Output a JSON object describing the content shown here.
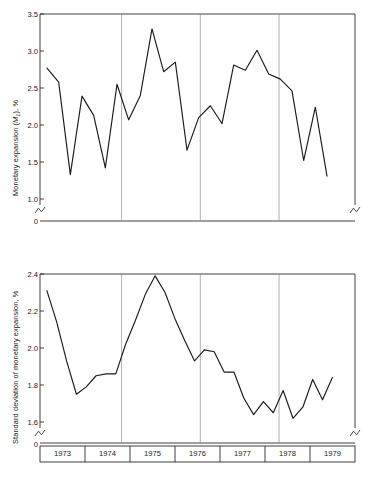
{
  "figure": {
    "background": "#ffffff",
    "line_color": "#1a1a1a",
    "grid_color": "#8f8f8f",
    "axis_color": "#2b2b2b"
  },
  "chart_data": [
    {
      "type": "line",
      "panel": "top",
      "title": "",
      "xlabel": "",
      "ylabel": "Monetary expansion (M1), %",
      "ylabel_parts": {
        "pre": "Monetary expansion (",
        "sym": "M",
        "sub": "1",
        "post": "), %"
      },
      "ylim": [
        1.0,
        3.5
      ],
      "yticks": [
        1.0,
        1.5,
        2.0,
        2.5,
        3.0,
        3.5
      ],
      "ytick_labels": [
        "1.0",
        "1.5",
        "2.0",
        "2.5",
        "3.0",
        "3.5"
      ],
      "axis_break_below": true,
      "zero_label": "0",
      "grid": "vertical-only",
      "xlim": [
        0,
        28
      ],
      "x": [
        0,
        1,
        2,
        3,
        4,
        5,
        6,
        7,
        8,
        9,
        10,
        11,
        12,
        13,
        14,
        15,
        16,
        17,
        18,
        19,
        20,
        21,
        22,
        23,
        24,
        25,
        26,
        27
      ],
      "values": [
        2.77,
        2.58,
        1.33,
        2.39,
        2.13,
        1.42,
        2.55,
        2.07,
        2.4,
        3.3,
        2.72,
        2.85,
        1.66,
        2.1,
        2.26,
        2.02,
        2.81,
        2.74,
        3.01,
        2.69,
        2.62,
        2.46,
        1.52,
        2.24,
        1.31
      ],
      "vertical_gridlines_at_x": [
        7.25,
        14.25,
        21.25
      ],
      "series": [
        {
          "name": "Monetary expansion (M1)",
          "values": [
            2.77,
            2.58,
            1.33,
            2.39,
            2.13,
            1.42,
            2.55,
            2.07,
            2.4,
            3.3,
            2.72,
            2.85,
            1.66,
            2.1,
            2.26,
            2.02,
            2.81,
            2.74,
            3.01,
            2.69,
            2.62,
            2.46,
            1.52,
            2.24,
            1.31
          ]
        }
      ]
    },
    {
      "type": "line",
      "panel": "bottom",
      "title": "",
      "xlabel": "",
      "ylabel": "Standard deviation of monetary expansion, %",
      "ylim": [
        1.6,
        2.4
      ],
      "yticks": [
        1.6,
        1.8,
        2.0,
        2.2,
        2.4
      ],
      "ytick_labels": [
        "1.6",
        "1.8",
        "2.0",
        "2.2",
        "2.4"
      ],
      "axis_break_below": true,
      "zero_label": "0",
      "grid": "vertical-only",
      "xlim": [
        0,
        28
      ],
      "categories": [
        "1973",
        "1974",
        "1975",
        "1976",
        "1977",
        "1978",
        "1979"
      ],
      "x": [
        0,
        1,
        2,
        3,
        4,
        5,
        6,
        7,
        8,
        9,
        10,
        11,
        12,
        13,
        14,
        15,
        16,
        17,
        18,
        19,
        20,
        21,
        22,
        23,
        24,
        25,
        26,
        27
      ],
      "values": [
        2.31,
        2.14,
        1.93,
        1.75,
        1.79,
        1.85,
        1.86,
        1.86,
        2.02,
        2.15,
        2.29,
        2.39,
        2.3,
        2.16,
        2.04,
        1.93,
        1.99,
        1.98,
        1.87,
        1.87,
        1.73,
        1.64,
        1.71,
        1.65,
        1.77,
        1.62,
        1.68,
        1.83,
        1.72,
        1.84
      ],
      "vertical_gridlines_at_x": [
        7.25,
        14.25,
        21.25
      ],
      "series": [
        {
          "name": "Standard deviation of monetary expansion",
          "values": [
            2.31,
            2.14,
            1.93,
            1.75,
            1.79,
            1.85,
            1.86,
            1.86,
            2.02,
            2.15,
            2.29,
            2.39,
            2.3,
            2.16,
            2.04,
            1.93,
            1.99,
            1.98,
            1.87,
            1.87,
            1.73,
            1.64,
            1.71,
            1.65,
            1.77,
            1.62,
            1.68,
            1.83,
            1.72,
            1.84
          ]
        }
      ]
    }
  ],
  "x_axis": {
    "years": [
      "1973",
      "1974",
      "1975",
      "1976",
      "1977",
      "1978",
      "1979"
    ]
  }
}
